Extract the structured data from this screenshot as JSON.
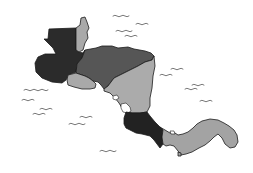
{
  "map": {
    "title": "Central America",
    "background": "#ffffff",
    "countries": [
      {
        "name": "Guatemala",
        "shade": "#2b2b2b"
      },
      {
        "name": "Belize",
        "shade": "#a9a9a9"
      },
      {
        "name": "Honduras",
        "shade": "#565656"
      },
      {
        "name": "El Salvador",
        "shade": "#a9a9a9"
      },
      {
        "name": "Nicaragua",
        "shade": "#ababab"
      },
      {
        "name": "Costa Rica",
        "shade": "#222222"
      },
      {
        "name": "Panama",
        "shade": "#a3a3a3"
      }
    ],
    "sea_marks": "wave-icon"
  }
}
